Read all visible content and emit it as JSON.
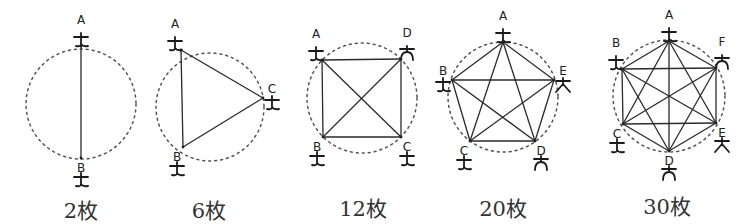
{
  "figure": {
    "panels": [
      {
        "caption": "2枚",
        "circle": {
          "cx": 81,
          "cy": 104,
          "r": 55
        },
        "people": [
          {
            "label": "A",
            "x": 81,
            "y": 46,
            "style": "a"
          },
          {
            "label": "B",
            "x": 81,
            "y": 158,
            "style": "b"
          }
        ],
        "edges": [
          [
            "A",
            "B"
          ]
        ],
        "caption_pos": {
          "x": 81,
          "y": 218
        }
      },
      {
        "caption": "6枚",
        "circle": {
          "cx": 210,
          "cy": 107,
          "r": 54
        },
        "people": [
          {
            "label": "A",
            "x": 181,
            "y": 50,
            "style": "a"
          },
          {
            "label": "B",
            "x": 183,
            "y": 147,
            "style": "b"
          },
          {
            "label": "C",
            "x": 263,
            "y": 98,
            "style": "c"
          }
        ],
        "edges": [
          [
            "A",
            "B"
          ],
          [
            "A",
            "C"
          ],
          [
            "B",
            "C"
          ]
        ],
        "caption_pos": {
          "x": 209,
          "y": 218
        }
      },
      {
        "caption": "12枚",
        "circle": {
          "cx": 362,
          "cy": 98,
          "r": 55
        },
        "people": [
          {
            "label": "A",
            "x": 322,
            "y": 60,
            "style": "a"
          },
          {
            "label": "D",
            "x": 401,
            "y": 59,
            "style": "d"
          },
          {
            "label": "B",
            "x": 323,
            "y": 137,
            "style": "b"
          },
          {
            "label": "C",
            "x": 401,
            "y": 137,
            "style": "c"
          }
        ],
        "edges": [
          [
            "A",
            "D"
          ],
          [
            "A",
            "B"
          ],
          [
            "A",
            "C"
          ],
          [
            "D",
            "B"
          ],
          [
            "D",
            "C"
          ],
          [
            "B",
            "C"
          ]
        ],
        "caption_pos": {
          "x": 363,
          "y": 216
        }
      },
      {
        "caption": "20枚",
        "circle": {
          "cx": 503,
          "cy": 97,
          "r": 55
        },
        "people": [
          {
            "label": "A",
            "x": 503,
            "y": 42,
            "style": "a"
          },
          {
            "label": "B",
            "x": 452,
            "y": 80,
            "style": "b"
          },
          {
            "label": "E",
            "x": 554,
            "y": 80,
            "style": "e"
          },
          {
            "label": "C",
            "x": 470,
            "y": 141,
            "style": "c"
          },
          {
            "label": "D",
            "x": 535,
            "y": 141,
            "style": "d"
          }
        ],
        "edges": [
          [
            "A",
            "B"
          ],
          [
            "A",
            "E"
          ],
          [
            "A",
            "C"
          ],
          [
            "A",
            "D"
          ],
          [
            "B",
            "E"
          ],
          [
            "B",
            "C"
          ],
          [
            "B",
            "D"
          ],
          [
            "E",
            "C"
          ],
          [
            "E",
            "D"
          ],
          [
            "C",
            "D"
          ]
        ],
        "caption_pos": {
          "x": 503,
          "y": 216
        }
      },
      {
        "caption": "30枚",
        "circle": {
          "cx": 669,
          "cy": 96,
          "r": 56
        },
        "people": [
          {
            "label": "A",
            "x": 669,
            "y": 41,
            "style": "a"
          },
          {
            "label": "B",
            "x": 622,
            "y": 69,
            "style": "b"
          },
          {
            "label": "F",
            "x": 716,
            "y": 68,
            "style": "d"
          },
          {
            "label": "C",
            "x": 623,
            "y": 124,
            "style": "c"
          },
          {
            "label": "E",
            "x": 716,
            "y": 123,
            "style": "e"
          },
          {
            "label": "D",
            "x": 669,
            "y": 151,
            "style": "d"
          }
        ],
        "edges": [
          [
            "A",
            "B"
          ],
          [
            "A",
            "F"
          ],
          [
            "A",
            "C"
          ],
          [
            "A",
            "E"
          ],
          [
            "A",
            "D"
          ],
          [
            "B",
            "F"
          ],
          [
            "B",
            "C"
          ],
          [
            "B",
            "E"
          ],
          [
            "B",
            "D"
          ],
          [
            "F",
            "C"
          ],
          [
            "F",
            "E"
          ],
          [
            "F",
            "D"
          ],
          [
            "C",
            "E"
          ],
          [
            "C",
            "D"
          ],
          [
            "E",
            "D"
          ]
        ],
        "caption_pos": {
          "x": 667,
          "y": 214
        }
      }
    ]
  }
}
